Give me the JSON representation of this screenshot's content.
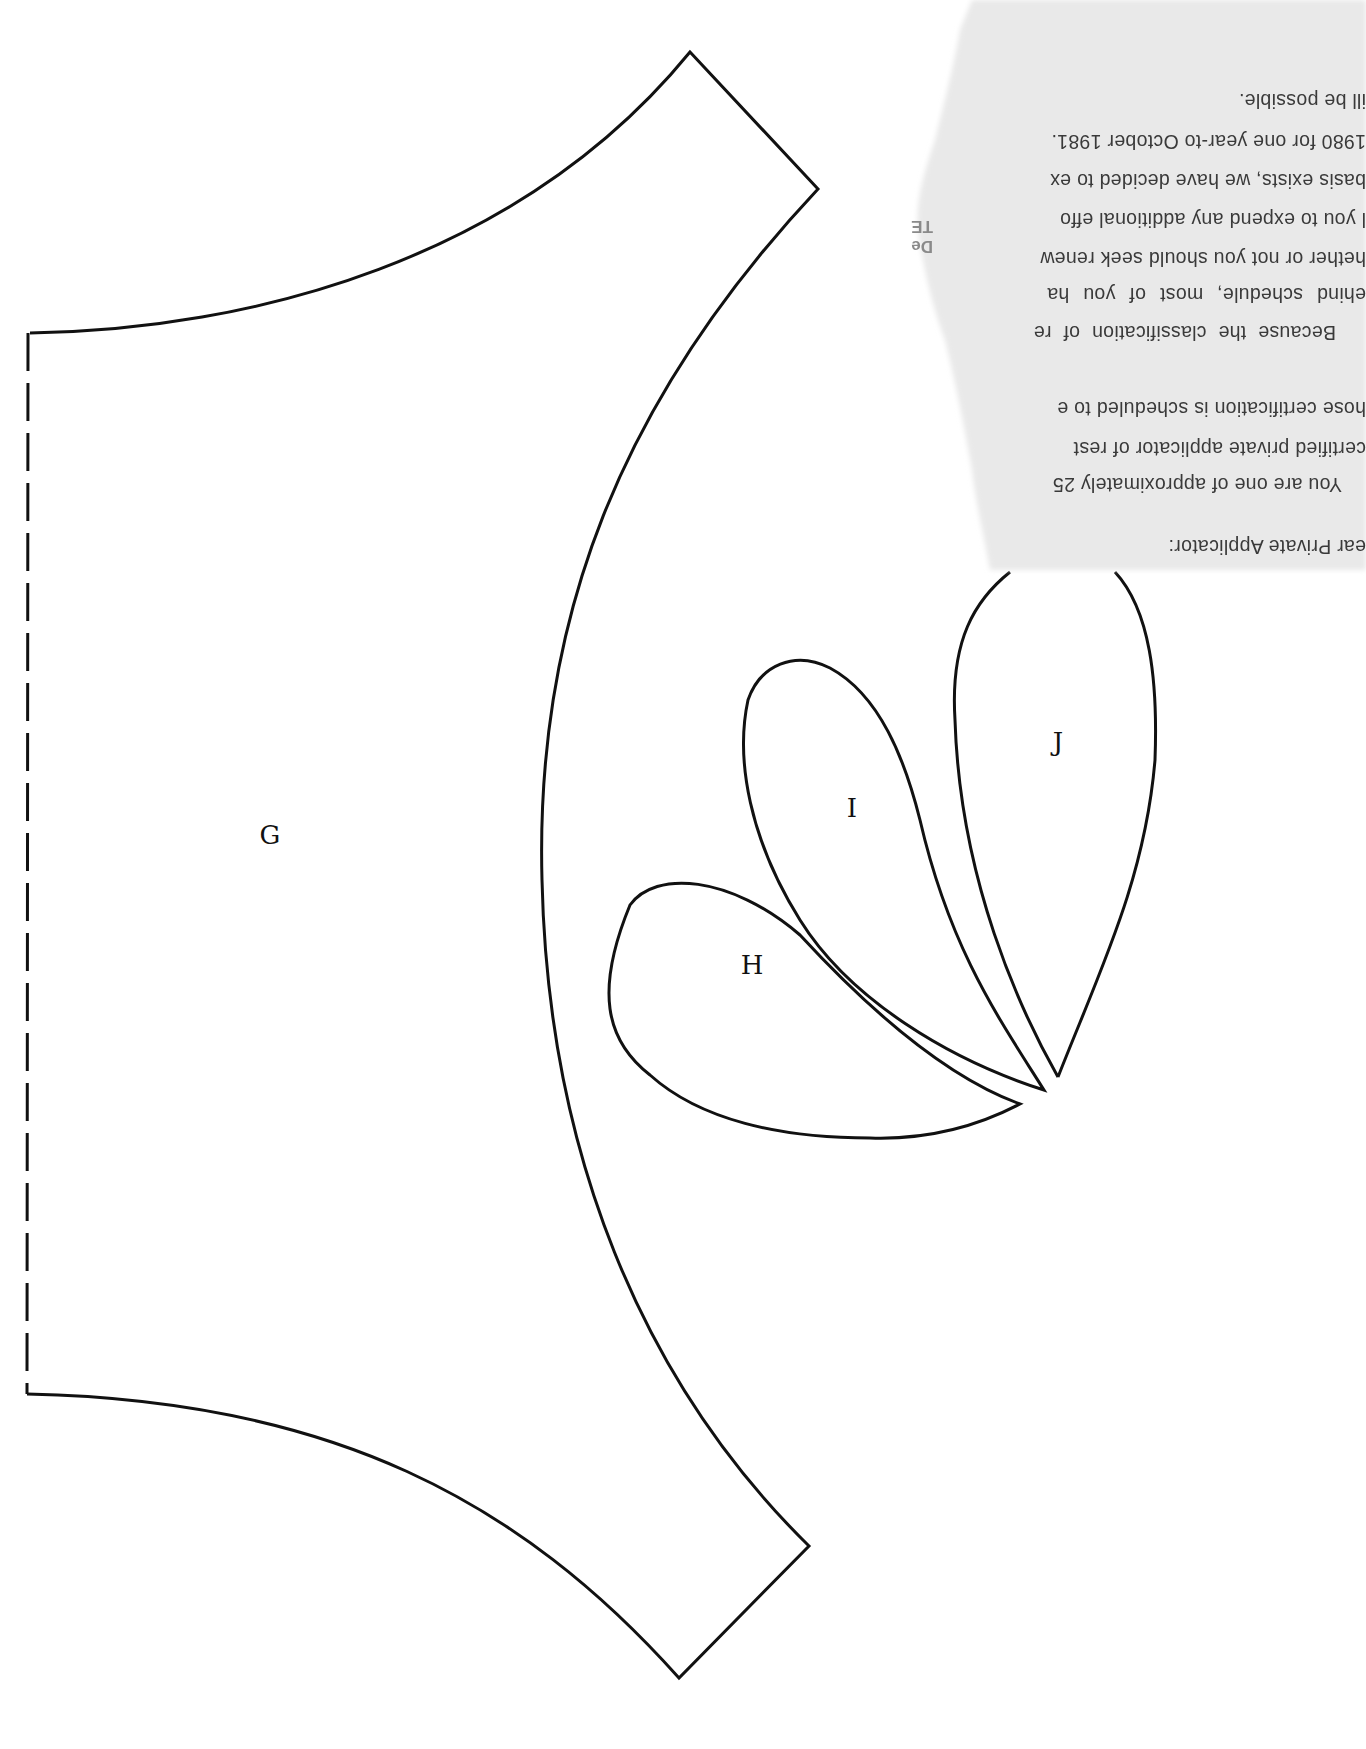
{
  "pattern": {
    "pieces": [
      {
        "id": "G",
        "label": "G"
      },
      {
        "id": "H",
        "label": "H"
      },
      {
        "id": "I",
        "label": "I"
      },
      {
        "id": "J",
        "label": "J"
      }
    ],
    "fold_line": "dashed"
  },
  "letter": {
    "orientation": "upside-down",
    "lines": [
      "ear Private Applicator:",
      "You are one of approximately 25",
      "certified private applicator of rest",
      "hose certification is scheduled to e",
      "Because the classification of re",
      "ehind schedule, most of you ha",
      "hether or not you should seek renew",
      "l you to expend any additional effo",
      "basis exists, we have decided to ex",
      "1980 for one year-to October 1981.",
      "ill be possible."
    ],
    "stamp_fragment": [
      "TE",
      "De"
    ]
  },
  "colors": {
    "ink": "#111111",
    "paper": "#e9e9e9",
    "background": "#ffffff",
    "letter_text": "#3a3a3a"
  }
}
